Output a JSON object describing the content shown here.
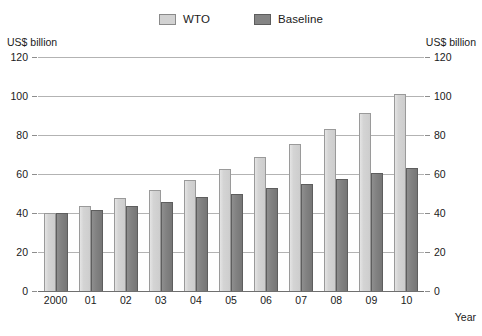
{
  "chart_data": {
    "type": "bar",
    "title": "",
    "subtitle": "",
    "xlabel": "Year",
    "ylabel": "US$ billion",
    "ylabel_right": "US$ billion",
    "categories": [
      "2000",
      "01",
      "02",
      "03",
      "04",
      "05",
      "06",
      "07",
      "08",
      "09",
      "10"
    ],
    "series": [
      {
        "name": "WTO",
        "color": "#d2d2d2",
        "values": [
          40,
          43.5,
          47.5,
          52,
          57,
          62.5,
          68.5,
          75.5,
          83,
          91.5,
          101
        ]
      },
      {
        "name": "Baseline",
        "color": "#848484",
        "values": [
          40,
          41.5,
          43.5,
          45.5,
          48,
          49.5,
          53,
          55,
          57.5,
          60.5,
          63
        ]
      }
    ],
    "ylim": [
      0,
      120
    ],
    "yticks": [
      0,
      20,
      40,
      60,
      80,
      100,
      120
    ],
    "ytick_labels": [
      "0",
      "20",
      "40",
      "60",
      "80",
      "100",
      "120"
    ],
    "grid": true,
    "grid_axis": "y",
    "legend_position": "top-center",
    "dual_y_axis": true
  },
  "legend": {
    "items": [
      {
        "label": "WTO",
        "swatch": "legend-swatch-wto"
      },
      {
        "label": "Baseline",
        "swatch": "legend-swatch-baseline"
      }
    ]
  },
  "axes": {
    "left_unit_caption": "US$ billion",
    "right_unit_caption": "US$ billion",
    "x_axis_title": "Year"
  },
  "colors": {
    "wto_fill": "#d2d2d2",
    "baseline_fill": "#848484",
    "gridline": "#b3b3b3",
    "axis": "#6f6f6f",
    "text": "#1a1a1a",
    "background": "#ffffff"
  }
}
